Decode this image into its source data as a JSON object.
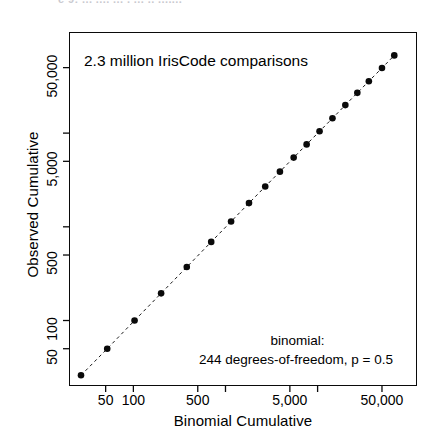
{
  "figure": {
    "top_crop_fragment": "e 9: ...  ....  ...  . ... .. .......",
    "background_color": "#ffffff",
    "ink_color": "#0a0a0a"
  },
  "annotations": {
    "headline": "2.3 million IrisCode comparisons",
    "model_label": "binomial:",
    "model_params": "244 degrees-of-freedom,  p = 0.5"
  },
  "chart_data": {
    "type": "scatter",
    "title": "2.3 million IrisCode comparisons",
    "xlabel": "Binomial Cumulative",
    "ylabel": "Observed Cumulative",
    "xscale": "log",
    "yscale": "log",
    "xlim": [
      20,
      120000
    ],
    "ylim": [
      20,
      120000
    ],
    "grid": false,
    "legend": null,
    "marker": "filled-circle",
    "line": "dashed-identity",
    "xticks": [
      50,
      100,
      500,
      1000,
      5000,
      10000,
      50000
    ],
    "xtick_labels": [
      "50",
      "100",
      "",
      "500",
      "",
      "5,000",
      "",
      "",
      "50,000"
    ],
    "xticks_labeled": [
      {
        "value": 50,
        "label": "50"
      },
      {
        "value": 100,
        "label": "100"
      },
      {
        "value": 500,
        "label": "500"
      },
      {
        "value": 5000,
        "label": "5,000"
      },
      {
        "value": 50000,
        "label": "50,000"
      }
    ],
    "xticks_unlabeled": [
      1000,
      10000
    ],
    "yticks": [
      50,
      100,
      500,
      1000,
      5000,
      10000,
      50000
    ],
    "yticks_labeled": [
      {
        "value": 50,
        "label": "50"
      },
      {
        "value": 100,
        "label": "100"
      },
      {
        "value": 500,
        "label": "500"
      },
      {
        "value": 5000,
        "label": "5,000"
      },
      {
        "value": 50000,
        "label": "50,000"
      }
    ],
    "yticks_unlabeled": [
      1000,
      10000
    ],
    "series": [
      {
        "name": "Observed vs Binomial cumulative",
        "x": [
          27,
          52,
          103,
          200,
          380,
          700,
          1150,
          1800,
          2700,
          3900,
          5500,
          7600,
          10500,
          14500,
          20000,
          27000,
          36000,
          50000,
          68000
        ],
        "y": [
          26,
          50,
          100,
          195,
          372,
          690,
          1140,
          1790,
          2690,
          3880,
          5480,
          7580,
          10450,
          14400,
          19900,
          26900,
          35800,
          49500,
          67500
        ]
      }
    ],
    "annotations": [
      {
        "text": "2.3 million IrisCode comparisons",
        "position": "top-left-inside"
      },
      {
        "text": "binomial:",
        "position": "bottom-right-inside"
      },
      {
        "text": "244 degrees-of-freedom,  p = 0.5",
        "position": "bottom-right-inside"
      }
    ]
  },
  "axes": {
    "x_title": "Binomial Cumulative",
    "y_title": "Observed Cumulative"
  }
}
